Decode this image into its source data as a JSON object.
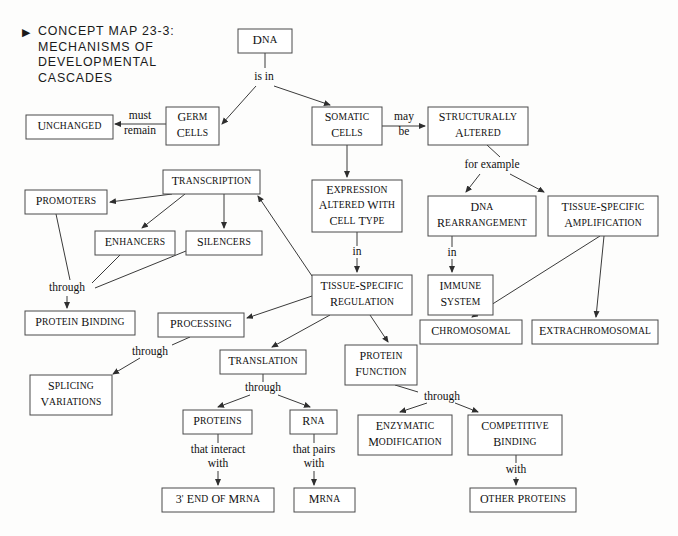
{
  "title": {
    "bullet": "▶",
    "lines": [
      "CONCEPT MAP 23-3:",
      "MECHANISMS OF",
      "DEVELOPMENTAL",
      "CASCADES"
    ]
  },
  "colors": {
    "background": "#fdfdfc",
    "box_fill": "#ffffff",
    "box_stroke": "#4a4a4a",
    "line": "#3a3a3a",
    "text": "#111111"
  },
  "nodes": [
    {
      "id": "dna",
      "label": "DNA",
      "lines": [
        "DNA"
      ],
      "x": 238,
      "y": 29,
      "w": 54,
      "h": 24,
      "fs": 13
    },
    {
      "id": "germ_cells",
      "label": "Germ Cells",
      "lines": [
        "Germ",
        "Cells"
      ],
      "x": 166,
      "y": 107,
      "w": 53,
      "h": 38,
      "fs": 12
    },
    {
      "id": "unchanged",
      "label": "Unchanged",
      "lines": [
        "Unchanged"
      ],
      "x": 26,
      "y": 115,
      "w": 87,
      "h": 24,
      "fs": 12
    },
    {
      "id": "somatic_cells",
      "label": "Somatic Cells",
      "lines": [
        "Somatic",
        "Cells"
      ],
      "x": 312,
      "y": 107,
      "w": 70,
      "h": 38,
      "fs": 12
    },
    {
      "id": "struct_altered",
      "label": "Structurally Altered",
      "lines": [
        "Structurally",
        "Altered"
      ],
      "x": 428,
      "y": 107,
      "w": 100,
      "h": 38,
      "fs": 12
    },
    {
      "id": "transcription",
      "label": "Transcription",
      "lines": [
        "Transcription"
      ],
      "x": 163,
      "y": 170,
      "w": 97,
      "h": 24,
      "fs": 12
    },
    {
      "id": "promoters",
      "label": "Promoters",
      "lines": [
        "Promoters"
      ],
      "x": 25,
      "y": 190,
      "w": 82,
      "h": 24,
      "fs": 12
    },
    {
      "id": "enhancers",
      "label": "Enhancers",
      "lines": [
        "Enhancers"
      ],
      "x": 95,
      "y": 231,
      "w": 80,
      "h": 24,
      "fs": 12
    },
    {
      "id": "silencers",
      "label": "Silencers",
      "lines": [
        "Silencers"
      ],
      "x": 186,
      "y": 231,
      "w": 76,
      "h": 24,
      "fs": 12
    },
    {
      "id": "protein_bind",
      "label": "Protein Binding",
      "lines": [
        "Protein Binding"
      ],
      "x": 25,
      "y": 311,
      "w": 110,
      "h": 24,
      "fs": 12
    },
    {
      "id": "expression",
      "label": "Expression Altered With Cell Type",
      "lines": [
        "Expression",
        "Altered With",
        "Cell Type"
      ],
      "x": 312,
      "y": 180,
      "w": 90,
      "h": 52,
      "fs": 12
    },
    {
      "id": "dna_rearr",
      "label": "DNA Rearrangement",
      "lines": [
        "DNA",
        "Rearrangement"
      ],
      "x": 428,
      "y": 196,
      "w": 108,
      "h": 40,
      "fs": 12
    },
    {
      "id": "tsa",
      "label": "Tissue-Specific Amplification",
      "lines": [
        "Tissue-Specific",
        "Amplification"
      ],
      "x": 548,
      "y": 196,
      "w": 110,
      "h": 40,
      "fs": 12
    },
    {
      "id": "immune",
      "label": "Immune System",
      "lines": [
        "Immune",
        "System"
      ],
      "x": 428,
      "y": 275,
      "w": 65,
      "h": 40,
      "fs": 12
    },
    {
      "id": "tsr",
      "label": "Tissue-Specific Regulation",
      "lines": [
        "Tissue-Specific",
        "Regulation"
      ],
      "x": 312,
      "y": 275,
      "w": 100,
      "h": 40,
      "fs": 12
    },
    {
      "id": "chromosomal",
      "label": "Chromosomal",
      "lines": [
        "Chromosomal"
      ],
      "x": 420,
      "y": 320,
      "w": 102,
      "h": 24,
      "fs": 12
    },
    {
      "id": "extrachrom",
      "label": "Extrachromosomal",
      "lines": [
        "Extrachromosomal"
      ],
      "x": 532,
      "y": 320,
      "w": 126,
      "h": 24,
      "fs": 12
    },
    {
      "id": "processing",
      "label": "Processing",
      "lines": [
        "Processing"
      ],
      "x": 158,
      "y": 313,
      "w": 86,
      "h": 24,
      "fs": 12
    },
    {
      "id": "splicing",
      "label": "Splicing Variations",
      "lines": [
        "Splicing",
        "Variations"
      ],
      "x": 30,
      "y": 375,
      "w": 82,
      "h": 40,
      "fs": 12
    },
    {
      "id": "translation",
      "label": "Translation",
      "lines": [
        "Translation"
      ],
      "x": 220,
      "y": 350,
      "w": 86,
      "h": 24,
      "fs": 12
    },
    {
      "id": "protein_func",
      "label": "Protein Function",
      "lines": [
        "Protein",
        "Function"
      ],
      "x": 345,
      "y": 345,
      "w": 72,
      "h": 40,
      "fs": 12
    },
    {
      "id": "proteins",
      "label": "Proteins",
      "lines": [
        "Proteins"
      ],
      "x": 183,
      "y": 410,
      "w": 69,
      "h": 24,
      "fs": 12
    },
    {
      "id": "rna",
      "label": "RNA",
      "lines": [
        "RNA"
      ],
      "x": 290,
      "y": 410,
      "w": 47,
      "h": 24,
      "fs": 12
    },
    {
      "id": "enzymatic",
      "label": "Enzymatic Modification",
      "lines": [
        "Enzymatic",
        "Modification"
      ],
      "x": 358,
      "y": 415,
      "w": 94,
      "h": 40,
      "fs": 12
    },
    {
      "id": "competitive",
      "label": "Competitive Binding",
      "lines": [
        "Competitive",
        "Binding"
      ],
      "x": 468,
      "y": 415,
      "w": 94,
      "h": 40,
      "fs": 12
    },
    {
      "id": "three_end",
      "label": "3' End Of mRNA",
      "lines": [
        "3' End Of mRNA"
      ],
      "x": 162,
      "y": 488,
      "w": 112,
      "h": 24,
      "fs": 12
    },
    {
      "id": "mrna",
      "label": "mRNA",
      "lines": [
        "mRNA"
      ],
      "x": 294,
      "y": 488,
      "w": 61,
      "h": 24,
      "fs": 12
    },
    {
      "id": "other_prot",
      "label": "Other Proteins",
      "lines": [
        "Other Proteins"
      ],
      "x": 470,
      "y": 488,
      "w": 106,
      "h": 24,
      "fs": 12
    }
  ],
  "edge_labels": [
    {
      "id": "is_in",
      "text": "is in",
      "x": 264,
      "y": 77
    },
    {
      "id": "must_remain",
      "text": "must",
      "x": 140,
      "y": 116
    },
    {
      "id": "must_remain2",
      "text": "remain",
      "x": 140,
      "y": 131
    },
    {
      "id": "may_be",
      "text": "may",
      "x": 404,
      "y": 117
    },
    {
      "id": "may_be2",
      "text": "be",
      "x": 404,
      "y": 132
    },
    {
      "id": "for_example",
      "text": "for example",
      "x": 492,
      "y": 165
    },
    {
      "id": "in_expr",
      "text": "in",
      "x": 357,
      "y": 252
    },
    {
      "id": "in_dna",
      "text": "in",
      "x": 452,
      "y": 253
    },
    {
      "id": "through_prot",
      "text": "through",
      "x": 67,
      "y": 288
    },
    {
      "id": "through_splice",
      "text": "through",
      "x": 150,
      "y": 352
    },
    {
      "id": "through_transl",
      "text": "through",
      "x": 263,
      "y": 388
    },
    {
      "id": "through_func",
      "text": "through",
      "x": 442,
      "y": 397
    },
    {
      "id": "that_interact",
      "text": "that interact",
      "x": 218,
      "y": 450
    },
    {
      "id": "that_interact2",
      "text": "with",
      "x": 218,
      "y": 464
    },
    {
      "id": "that_pairs",
      "text": "that pairs",
      "x": 314,
      "y": 450
    },
    {
      "id": "that_pairs2",
      "text": "with",
      "x": 314,
      "y": 464
    },
    {
      "id": "with_other",
      "text": "with",
      "x": 516,
      "y": 470
    }
  ],
  "edges": [
    {
      "id": "dna-isin",
      "from": "DNA",
      "to": "is in",
      "d": "M 265 53 L 265 68",
      "arrow": false
    },
    {
      "id": "isin-germ",
      "from": "is in",
      "to": "Germ Cells",
      "d": "M 256 86 L 222 124",
      "arrow": true
    },
    {
      "id": "isin-somatic",
      "from": "is in",
      "to": "Somatic Cells",
      "d": "M 274 86 L 330 105",
      "arrow": true
    },
    {
      "id": "germ-unchanged",
      "from": "Germ Cells",
      "to": "Unchanged",
      "d": "M 166 124 L 115 124",
      "arrow": true
    },
    {
      "id": "somatic-struct",
      "from": "Somatic Cells",
      "to": "Structurally Altered",
      "d": "M 382 126 L 425 126",
      "arrow": true
    },
    {
      "id": "somatic-expr",
      "from": "Somatic Cells",
      "to": "Expression Altered With Cell Type",
      "d": "M 347 145 L 347 177",
      "arrow": true
    },
    {
      "id": "struct-forex",
      "from": "Structurally Altered",
      "to": "for example",
      "d": "M 487 145 L 500 157",
      "arrow": false
    },
    {
      "id": "forex-dnarearr",
      "from": "for example",
      "to": "DNA Rearrangement",
      "d": "M 480 174 L 466 192",
      "arrow": true
    },
    {
      "id": "forex-tsa",
      "from": "for example",
      "to": "Tissue-Specific Amplification",
      "d": "M 510 174 L 544 192",
      "arrow": true
    },
    {
      "id": "expr-in",
      "from": "Expression Altered With Cell Type",
      "to": "in",
      "d": "M 357 232 L 357 246",
      "arrow": false
    },
    {
      "id": "in-tsr",
      "from": "in",
      "to": "Tissue-Specific Regulation",
      "d": "M 357 258 L 357 272",
      "arrow": true
    },
    {
      "id": "dnarearr-in",
      "from": "DNA Rearrangement",
      "to": "in",
      "d": "M 452 236 L 452 247",
      "arrow": false
    },
    {
      "id": "in-immune",
      "from": "in",
      "to": "Immune System",
      "d": "M 452 259 L 452 272",
      "arrow": true
    },
    {
      "id": "tsa-chrom",
      "from": "Tissue-Specific Amplification",
      "to": "Chromosomal",
      "d": "M 600 236 L 472 317",
      "arrow": true
    },
    {
      "id": "tsa-extra",
      "from": "Tissue-Specific Amplification",
      "to": "Extrachromosomal",
      "d": "M 604 236 L 596 317",
      "arrow": true
    },
    {
      "id": "tsr-transcription",
      "from": "Tissue-Specific Regulation",
      "to": "Transcription",
      "d": "M 312 276 L 258 196",
      "arrow": true
    },
    {
      "id": "trans-promoters",
      "from": "Transcription",
      "to": "Promoters",
      "d": "M 172 194 L 110 202",
      "arrow": true
    },
    {
      "id": "trans-enhancers",
      "from": "Transcription",
      "to": "Enhancers",
      "d": "M 185 194 L 142 228",
      "arrow": true
    },
    {
      "id": "trans-silencers",
      "from": "Transcription",
      "to": "Silencers",
      "d": "M 224 194 L 224 228",
      "arrow": true
    },
    {
      "id": "promoters-through",
      "from": "Promoters",
      "to": "through",
      "d": "M 56 214 L 70 280",
      "arrow": false
    },
    {
      "id": "enhancers-through",
      "from": "Enhancers",
      "to": "through",
      "d": "M 120 255 L 92 283",
      "arrow": false
    },
    {
      "id": "silencers-through",
      "from": "Silencers",
      "to": "through",
      "d": "M 186 251 L 95 288",
      "arrow": false
    },
    {
      "id": "through-protbind",
      "from": "through",
      "to": "Protein Binding",
      "d": "M 67 296 L 67 308",
      "arrow": true
    },
    {
      "id": "tsr-processing",
      "from": "Tissue-Specific Regulation",
      "to": "Processing",
      "d": "M 312 296 L 247 318",
      "arrow": true
    },
    {
      "id": "processing-thr",
      "from": "Processing",
      "to": "through",
      "d": "M 190 337 L 172 345",
      "arrow": false
    },
    {
      "id": "thr-splicing",
      "from": "through",
      "to": "Splicing Variations",
      "d": "M 140 358 L 113 374",
      "arrow": true
    },
    {
      "id": "tsr-translation",
      "from": "Tissue-Specific Regulation",
      "to": "Translation",
      "d": "M 330 315 L 272 347",
      "arrow": true
    },
    {
      "id": "tsr-protfunc",
      "from": "Tissue-Specific Regulation",
      "to": "Protein Function",
      "d": "M 370 315 L 388 342",
      "arrow": true
    },
    {
      "id": "transl-through",
      "from": "Translation",
      "to": "through",
      "d": "M 263 374 L 263 382",
      "arrow": false
    },
    {
      "id": "through-proteins",
      "from": "through",
      "to": "Proteins",
      "d": "M 250 395 L 218 407",
      "arrow": true
    },
    {
      "id": "through-rna",
      "from": "through",
      "to": "RNA",
      "d": "M 278 395 L 310 407",
      "arrow": true
    },
    {
      "id": "protfunc-through",
      "from": "Protein Function",
      "to": "through",
      "d": "M 395 385 L 418 392",
      "arrow": false
    },
    {
      "id": "through-enzym",
      "from": "through",
      "to": "Enzymatic Modification",
      "d": "M 427 403 L 400 412",
      "arrow": true
    },
    {
      "id": "through-comp",
      "from": "through",
      "to": "Competitive Binding",
      "d": "M 455 403 L 478 412",
      "arrow": true
    },
    {
      "id": "proteins-label",
      "from": "Proteins",
      "to": "that interact with",
      "d": "M 218 434 L 218 443",
      "arrow": false
    },
    {
      "id": "label-3end",
      "from": "that interact with",
      "to": "3' End Of mRNA",
      "d": "M 218 471 L 218 485",
      "arrow": true
    },
    {
      "id": "rna-label",
      "from": "RNA",
      "to": "that pairs with",
      "d": "M 314 434 L 314 443",
      "arrow": false
    },
    {
      "id": "label-mrna",
      "from": "that pairs with",
      "to": "mRNA",
      "d": "M 314 471 L 314 485",
      "arrow": true
    },
    {
      "id": "comp-with",
      "from": "Competitive Binding",
      "to": "with",
      "d": "M 516 455 L 516 463",
      "arrow": false
    },
    {
      "id": "with-otherprot",
      "from": "with",
      "to": "Other Proteins",
      "d": "M 516 477 L 516 485",
      "arrow": true
    }
  ]
}
